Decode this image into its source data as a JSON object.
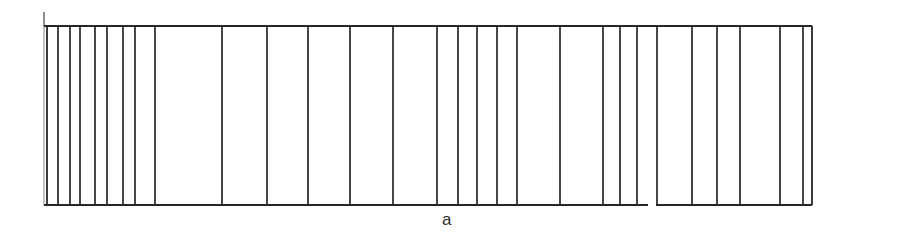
{
  "figure": {
    "caption": "a",
    "caption_position": {
      "x": 450,
      "y": 210
    },
    "background_color": "#ffffff",
    "ink_color": "#262626"
  },
  "chart_data": {
    "type": "bar",
    "title": "",
    "subtitle": "",
    "xlabel": "a",
    "ylabel": "",
    "grid": false,
    "legend": null,
    "axis_ranges": {
      "x_pixels": [
        44,
        812
      ],
      "y_pixels": [
        26,
        205
      ]
    },
    "rails": {
      "top_y": 26,
      "bottom_y": 205,
      "top_x_start": 44,
      "top_x_end": 812,
      "bottom_segments": [
        {
          "x_start": 44,
          "x_end": 648
        },
        {
          "x_start": 656,
          "x_end": 812
        }
      ]
    },
    "left_axis_spur": {
      "x": 44,
      "y_top": 12,
      "y_bottom": 26
    },
    "categories": [
      "l1",
      "l2",
      "l3",
      "l4",
      "l5",
      "l6",
      "l7",
      "l8",
      "l9",
      "l10",
      "l11",
      "l12",
      "l13",
      "l14",
      "l15",
      "l16",
      "l17",
      "l18",
      "l19",
      "l20",
      "l21",
      "l22",
      "l23",
      "l24",
      "l25",
      "l26",
      "l27",
      "l28",
      "l29",
      "l30",
      "l31",
      "l32",
      "l33"
    ],
    "x": [
      47,
      58,
      70,
      80,
      95,
      107,
      123,
      135,
      155,
      222,
      267,
      308,
      350,
      393,
      437,
      458,
      477,
      497,
      517,
      560,
      603,
      620,
      637,
      657,
      692,
      717,
      740,
      780,
      803,
      823,
      845,
      860,
      812
    ],
    "values": [
      179,
      179,
      179,
      179,
      179,
      179,
      179,
      179,
      179,
      179,
      179,
      179,
      179,
      179,
      179,
      179,
      179,
      179,
      179,
      179,
      179,
      179,
      179,
      179,
      179,
      179,
      179,
      179,
      179,
      179,
      179,
      179,
      179
    ],
    "line_positions_px": [
      47,
      58,
      70,
      80,
      95,
      107,
      123,
      135,
      155,
      222,
      267,
      308,
      350,
      393,
      437,
      458,
      477,
      497,
      517,
      560,
      603,
      620,
      637,
      657,
      692,
      717,
      740,
      780,
      803,
      812
    ],
    "cell_widths_px": [
      11,
      12,
      10,
      15,
      12,
      16,
      12,
      20,
      67,
      45,
      41,
      42,
      43,
      44,
      21,
      19,
      20,
      20,
      43,
      43,
      17,
      17,
      20,
      35,
      25,
      23,
      40,
      23,
      9
    ],
    "line_count": 30,
    "ylim": [
      0,
      179
    ],
    "xlim": [
      44,
      812
    ]
  }
}
